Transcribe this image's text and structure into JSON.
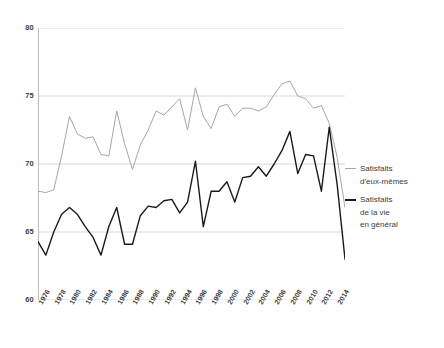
{
  "chart_data": {
    "type": "line",
    "title": "",
    "subtitle": "",
    "xlabel": "",
    "ylabel": "",
    "ylim": [
      60,
      80
    ],
    "yticks": [
      60,
      65,
      70,
      75,
      80
    ],
    "ytick_labels": [
      "60",
      "65",
      "70",
      "75",
      "80"
    ],
    "grid": true,
    "grid_axis": "y",
    "legend_position": "right",
    "xlim": [
      1976,
      2015
    ],
    "xticks": [
      1976,
      1978,
      1980,
      1982,
      1984,
      1986,
      1988,
      1990,
      1992,
      1994,
      1996,
      1998,
      2000,
      2002,
      2004,
      2006,
      2008,
      2010,
      2012,
      2014
    ],
    "xtick_labels": [
      "1976",
      "1978",
      "1980",
      "1982",
      "1984",
      "1986",
      "1988",
      "1990",
      "1992",
      "1994",
      "1996",
      "1998",
      "2000",
      "2002",
      "2004",
      "2006",
      "2008",
      "2010",
      "2012",
      "2014"
    ],
    "x": [
      1976,
      1977,
      1978,
      1979,
      1980,
      1981,
      1982,
      1983,
      1984,
      1985,
      1986,
      1987,
      1988,
      1989,
      1990,
      1991,
      1992,
      1993,
      1994,
      1995,
      1996,
      1997,
      1998,
      1999,
      2000,
      2001,
      2002,
      2003,
      2004,
      2005,
      2006,
      2007,
      2008,
      2009,
      2010,
      2011,
      2012,
      2013,
      2014,
      2015
    ],
    "series": [
      {
        "name": "Satisfaits d'eux-mêmes",
        "color": "#a6a6a6",
        "linewidth": 1,
        "values": [
          68.0,
          67.9,
          68.1,
          70.6,
          73.5,
          72.2,
          71.9,
          72.0,
          70.7,
          70.6,
          73.9,
          71.5,
          69.6,
          71.4,
          72.5,
          73.9,
          73.6,
          74.2,
          74.8,
          72.5,
          75.6,
          73.5,
          72.6,
          74.2,
          74.4,
          73.5,
          74.1,
          74.1,
          73.9,
          74.2,
          75.1,
          75.9,
          76.1,
          75.0,
          74.8,
          74.1,
          74.3,
          73.0,
          70.5,
          66.8
        ]
      },
      {
        "name": "Satisfaits de la vie en général",
        "color": "#1a1a1a",
        "linewidth": 1.4,
        "values": [
          64.3,
          63.3,
          65.0,
          66.3,
          66.8,
          66.3,
          65.4,
          64.6,
          63.3,
          65.4,
          66.8,
          64.1,
          64.1,
          66.2,
          66.9,
          66.8,
          67.3,
          67.4,
          66.4,
          67.2,
          70.2,
          65.4,
          68.0,
          68.0,
          68.7,
          67.2,
          69.0,
          69.1,
          69.8,
          69.1,
          70.0,
          71.0,
          72.4,
          69.3,
          70.7,
          70.6,
          68.0,
          72.7,
          68.5,
          63.0
        ]
      }
    ]
  },
  "legend": {
    "entries": [
      {
        "swatch": "gray-line-swatch",
        "line1": "Satisfaits",
        "line2": "d'eux-mêmes",
        "line3": ""
      },
      {
        "swatch": "black-line-swatch",
        "line1": "Satisfaits",
        "line2": "de la vie",
        "line3": "en général"
      }
    ]
  },
  "axis_colors": {
    "grid": "#d9d9d9",
    "axis": "#bfbfbf",
    "tick_text": "#3d3d3d"
  }
}
